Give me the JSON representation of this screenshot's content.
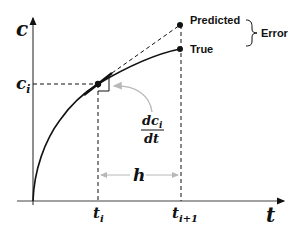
{
  "diagram": {
    "type": "euler-method-illustration",
    "axes": {
      "y_label": "c",
      "x_label": "t"
    },
    "labels": {
      "ci": "c",
      "ci_sub": "i",
      "ti": "t",
      "ti_sub": "i",
      "ti1": "t",
      "ti1_sub": "i+1",
      "h": "h",
      "slope_num": "dc",
      "slope_num_sub": "i",
      "slope_den": "dt",
      "predicted": "Predicted",
      "true": "True",
      "error": "Error"
    },
    "colors": {
      "line": "#111111",
      "grey_arrow": "#b8b8b8",
      "background": "#ffffff"
    }
  }
}
